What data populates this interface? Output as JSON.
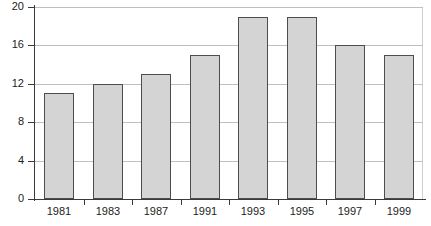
{
  "chart_data": {
    "type": "bar",
    "title": "",
    "subtitle": "",
    "xlabel": "",
    "ylabel": "",
    "categories": [
      "1981",
      "1983",
      "1987",
      "1991",
      "1993",
      "1995",
      "1997",
      "1999"
    ],
    "values": [
      11,
      12,
      13,
      15,
      19,
      19,
      16,
      15
    ],
    "ylim": [
      0,
      20
    ],
    "yticks": [
      "0",
      "4",
      "8",
      "12",
      "16",
      "20"
    ],
    "ytick_values": [
      0,
      4,
      8,
      12,
      16,
      20
    ],
    "grid": true,
    "grid_axis": "y",
    "legend": false,
    "legend_position": "none",
    "annotations": []
  },
  "style": {
    "bar_fill": "#d4d4d4",
    "bar_stroke": "#4d4d4d",
    "grid_color": "#bfbfbf",
    "axis_color": "#3a3a3a",
    "text_color": "#1b1b1b",
    "background": "#ffffff"
  }
}
